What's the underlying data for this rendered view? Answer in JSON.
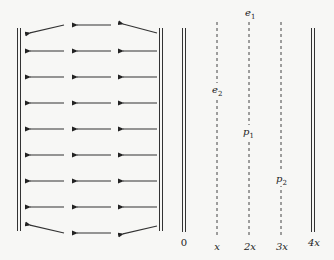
{
  "diagram": {
    "left_panel": {
      "description": "Field vector arrows between two plates pointing left",
      "rows_y": [
        25,
        51,
        77,
        103,
        129,
        155,
        181,
        207,
        233
      ],
      "columns": [
        [
          64,
          25
        ],
        [
          111,
          72
        ],
        [
          157,
          118
        ]
      ],
      "arrow_direction": "left"
    },
    "right_panel": {
      "axis_labels": [
        {
          "text": "0",
          "x": 184
        },
        {
          "text": "x",
          "x": 217
        },
        {
          "text": "2x",
          "x": 249
        },
        {
          "text": "3x",
          "x": 281
        },
        {
          "text": "4x",
          "x": 313
        }
      ],
      "point_labels": {
        "e1": {
          "base": "e",
          "sub": "1"
        },
        "e2": {
          "base": "e",
          "sub": "2"
        },
        "p1": {
          "base": "p",
          "sub": "1"
        },
        "p2": {
          "base": "p",
          "sub": "2"
        }
      }
    },
    "colors": {
      "line": "#333333",
      "dashed": "#444444",
      "background": "#f7f7f5"
    }
  }
}
